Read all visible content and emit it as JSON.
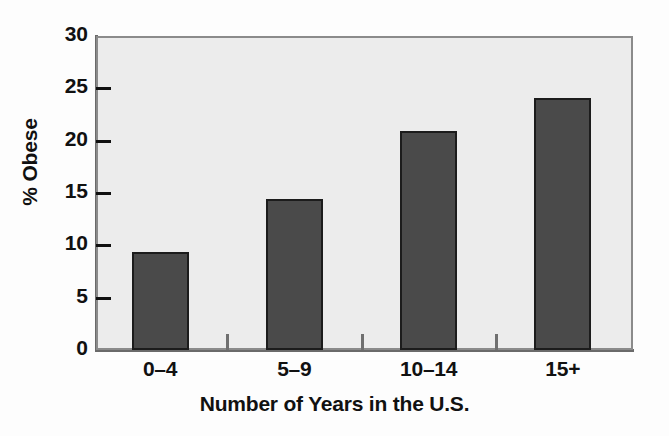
{
  "chart_data": {
    "type": "bar",
    "title": "",
    "categories": [
      "0–4",
      "5–9",
      "10–14",
      "15+"
    ],
    "values": [
      9.4,
      14.4,
      20.9,
      24.1
    ],
    "xlabel": "Number of Years in the U.S.",
    "ylabel": "% Obese",
    "ylim": [
      0,
      30
    ],
    "yticks": [
      0,
      5,
      10,
      15,
      20,
      25,
      30
    ],
    "ytick_labels": [
      "0",
      "5",
      "10",
      "15",
      "20",
      "25",
      "30"
    ],
    "grid": false,
    "legend": null,
    "bar_color": "#4a4a4a",
    "bar_edge_color": "#1c1c1c",
    "plot_background": "#ececec",
    "axis_color": "#6a6a6a",
    "text_color": "#111111"
  },
  "axes": {
    "y_title": "% Obese",
    "x_title": "Number of Years in the U.S."
  },
  "ticks": {
    "y": [
      {
        "label": "30",
        "value": 30
      },
      {
        "label": "25",
        "value": 25
      },
      {
        "label": "20",
        "value": 20
      },
      {
        "label": "15",
        "value": 15
      },
      {
        "label": "10",
        "value": 10
      },
      {
        "label": "5",
        "value": 5
      },
      {
        "label": "0",
        "value": 0
      }
    ],
    "x": [
      {
        "label": "0–4"
      },
      {
        "label": "5–9"
      },
      {
        "label": "10–14"
      },
      {
        "label": "15+"
      }
    ]
  }
}
